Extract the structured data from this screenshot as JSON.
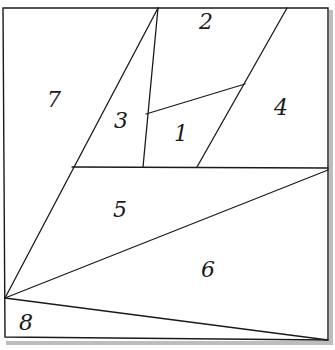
{
  "diagram": {
    "type": "partitioned-square",
    "stroke_color": "#1a1a1a",
    "background": "#ffffff",
    "regions": [
      {
        "id": "1",
        "label": "1",
        "x": 181,
        "y": 141
      },
      {
        "id": "2",
        "label": "2",
        "x": 206,
        "y": 29
      },
      {
        "id": "3",
        "label": "3",
        "x": 121,
        "y": 128
      },
      {
        "id": "4",
        "label": "4",
        "x": 281,
        "y": 115
      },
      {
        "id": "5",
        "label": "5",
        "x": 120,
        "y": 217
      },
      {
        "id": "6",
        "label": "6",
        "x": 208,
        "y": 277
      },
      {
        "id": "7",
        "label": "7",
        "x": 54,
        "y": 107
      },
      {
        "id": "8",
        "label": "8",
        "x": 26,
        "y": 330
      }
    ]
  }
}
